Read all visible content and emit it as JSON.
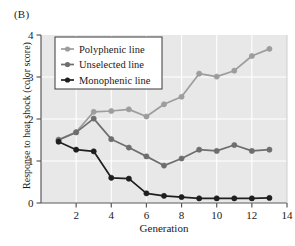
{
  "figure": {
    "panel_label": "(B)",
    "background_color": "#ffffff"
  },
  "chart_data": {
    "type": "line",
    "title": "",
    "xlabel": "Generation",
    "ylabel": "Response to heat shock (color score)",
    "xlim": [
      0,
      14
    ],
    "ylim": [
      0,
      4
    ],
    "xticks": [
      2,
      4,
      6,
      8,
      10,
      12,
      14
    ],
    "xticklabels": [
      "2",
      "4",
      "6",
      "8",
      "10",
      "12",
      "14"
    ],
    "yticks": [
      0,
      1,
      2,
      3,
      4
    ],
    "yticklabels": [
      "0",
      "1",
      "2",
      "3",
      "4"
    ],
    "grid": true,
    "grid_color": "#ffffff",
    "plot_background": "#e8e8e8",
    "legend_position": "upper left",
    "x": [
      1,
      2,
      3,
      4,
      5,
      6,
      7,
      8,
      9,
      10,
      11,
      12,
      13
    ],
    "series": [
      {
        "name": "Polyphenic line",
        "color": "#9d9d9d",
        "marker": "circle",
        "values": [
          1.51,
          1.69,
          2.17,
          2.19,
          2.23,
          2.06,
          2.35,
          2.53,
          3.08,
          3.01,
          3.15,
          3.5,
          3.67
        ]
      },
      {
        "name": "Unselected line",
        "color": "#6e6e6e",
        "marker": "circle",
        "values": [
          1.5,
          1.68,
          2.01,
          1.52,
          1.32,
          1.11,
          0.89,
          1.06,
          1.27,
          1.24,
          1.38,
          1.24,
          1.27
        ]
      },
      {
        "name": "Monophenic line",
        "color": "#1f1f1f",
        "marker": "circle",
        "values": [
          1.46,
          1.27,
          1.23,
          0.6,
          0.58,
          0.23,
          0.17,
          0.14,
          0.11,
          0.11,
          0.11,
          0.11,
          0.12
        ]
      }
    ]
  },
  "legend": {
    "items": [
      {
        "label": "Polyphenic line",
        "color": "#9d9d9d"
      },
      {
        "label": "Unselected line",
        "color": "#6e6e6e"
      },
      {
        "label": "Monophenic line",
        "color": "#1f1f1f"
      }
    ]
  }
}
